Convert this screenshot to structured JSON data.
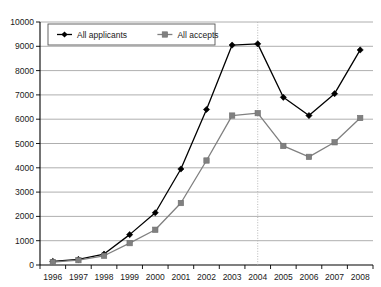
{
  "chart_data": {
    "type": "line",
    "title": "",
    "xlabel": "",
    "ylabel": "",
    "categories": [
      1996,
      1997,
      1998,
      1999,
      2000,
      2001,
      2002,
      2003,
      2004,
      2005,
      2006,
      2007,
      2008
    ],
    "tick_labels_x": [
      "1996",
      "1997",
      "1998",
      "1999",
      "2000",
      "2001",
      "2002",
      "2003",
      "2004",
      "2005",
      "2006",
      "2007",
      "2008"
    ],
    "tick_labels_y": [
      "0",
      "1000",
      "2000",
      "3000",
      "4000",
      "5000",
      "6000",
      "7000",
      "8000",
      "9000",
      "10000"
    ],
    "ylim": [
      0,
      10000
    ],
    "ytick_step": 1000,
    "grid": "horizontal",
    "legend_position": "top-left-inside",
    "series": [
      {
        "name": "All applicants",
        "color": "#000000",
        "marker": "diamond",
        "values": [
          150,
          230,
          450,
          1250,
          2150,
          3950,
          6400,
          9050,
          9100,
          6900,
          6150,
          7050,
          8850
        ]
      },
      {
        "name": "All accepts",
        "color": "#808080",
        "marker": "square",
        "values": [
          120,
          200,
          380,
          900,
          1450,
          2550,
          4300,
          6150,
          6250,
          4900,
          4450,
          5050,
          6050
        ]
      }
    ],
    "annotations": [
      {
        "type": "vertical-dotted-line",
        "at_x": 2004,
        "color": "#b0b0b0"
      }
    ]
  },
  "legend": {
    "items": [
      {
        "label": "All applicants"
      },
      {
        "label": "All accepts"
      }
    ]
  }
}
